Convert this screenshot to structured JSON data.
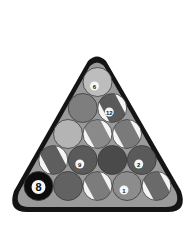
{
  "image": {
    "subject": "Racked billiard balls in triangle",
    "style": "grayscale"
  },
  "rack": {
    "frame_color": "#141414",
    "felt_color": "#9a9a9a"
  },
  "balls": [
    {
      "row": 0,
      "col": 0,
      "label": "6",
      "kind": "solid",
      "shade": "#bdbdbd"
    },
    {
      "row": 1,
      "col": 0,
      "label": "",
      "kind": "solid",
      "shade": "#7e7e7e"
    },
    {
      "row": 1,
      "col": 1,
      "label": "12",
      "kind": "stripe",
      "shade": "#5a5a5a"
    },
    {
      "row": 2,
      "col": 0,
      "label": "",
      "kind": "solid",
      "shade": "#b4b4b4"
    },
    {
      "row": 2,
      "col": 1,
      "label": "",
      "kind": "stripe",
      "shade": "#8a8a8a"
    },
    {
      "row": 2,
      "col": 2,
      "label": "",
      "kind": "stripe",
      "shade": "#7a7a7a"
    },
    {
      "row": 3,
      "col": 0,
      "label": "",
      "kind": "stripe",
      "shade": "#5e5e5e"
    },
    {
      "row": 3,
      "col": 1,
      "label": "9",
      "kind": "solid",
      "shade": "#5a5a5a"
    },
    {
      "row": 3,
      "col": 2,
      "label": "",
      "kind": "solid",
      "shade": "#4a4a4a"
    },
    {
      "row": 3,
      "col": 3,
      "label": "2",
      "kind": "solid",
      "shade": "#5a5a5a"
    },
    {
      "row": 4,
      "col": 0,
      "label": "8",
      "kind": "solid",
      "shade": "#0c0c0c"
    },
    {
      "row": 4,
      "col": 1,
      "label": "",
      "kind": "solid",
      "shade": "#626262"
    },
    {
      "row": 4,
      "col": 2,
      "label": "",
      "kind": "stripe",
      "shade": "#7c7c7c"
    },
    {
      "row": 4,
      "col": 3,
      "label": "1",
      "kind": "solid",
      "shade": "#8c8c8c"
    },
    {
      "row": 4,
      "col": 4,
      "label": "",
      "kind": "stripe",
      "shade": "#6a6a6a"
    }
  ]
}
